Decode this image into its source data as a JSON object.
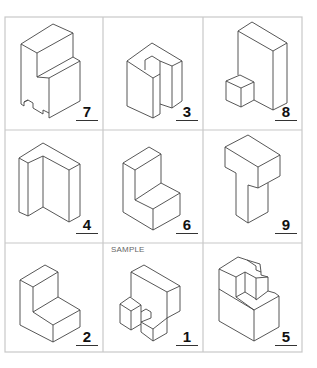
{
  "worksheet": {
    "sample_label": "SAMPLE",
    "cells": [
      {
        "row": 0,
        "col": 0,
        "number": "7",
        "shape": "stepped-block-with-notch"
      },
      {
        "row": 0,
        "col": 1,
        "number": "3",
        "shape": "u-channel-block"
      },
      {
        "row": 0,
        "col": 2,
        "number": "8",
        "shape": "tall-slab-with-cube"
      },
      {
        "row": 1,
        "col": 0,
        "number": "4",
        "shape": "l-wall-block"
      },
      {
        "row": 1,
        "col": 1,
        "number": "6",
        "shape": "l-step-block"
      },
      {
        "row": 1,
        "col": 2,
        "number": "9",
        "shape": "t-block"
      },
      {
        "row": 2,
        "col": 0,
        "number": "2",
        "shape": "l-step-block"
      },
      {
        "row": 2,
        "col": 1,
        "number": "1",
        "shape": "sample-wall-with-blocks",
        "is_sample": true
      },
      {
        "row": 2,
        "col": 2,
        "number": "5",
        "shape": "stepped-hollow-block"
      }
    ]
  }
}
